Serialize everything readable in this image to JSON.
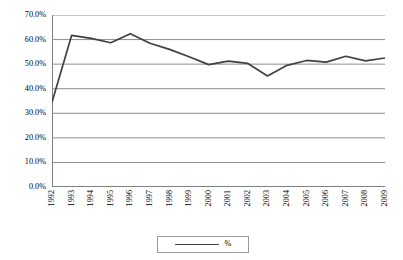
{
  "chart_data": {
    "type": "line",
    "title": "",
    "subtitle": "",
    "xlabel": "",
    "ylabel": "",
    "categories": [
      "1992",
      "1993",
      "1994",
      "1995",
      "1996",
      "1997",
      "1998",
      "1999",
      "2000",
      "2001",
      "2002",
      "2003",
      "2004",
      "2005",
      "2006",
      "2007",
      "2008",
      "2009"
    ],
    "series": [
      {
        "name": "%",
        "values": [
          34.5,
          61.7,
          60.5,
          58.7,
          62.4,
          58.5,
          56.0,
          53.0,
          49.8,
          51.2,
          50.3,
          45.2,
          49.5,
          51.5,
          50.8,
          53.2,
          51.3,
          52.5
        ],
        "color": "#404040"
      }
    ],
    "ylim": [
      0,
      70
    ],
    "ytick_values": [
      0,
      10,
      20,
      30,
      40,
      50,
      60,
      70
    ],
    "ytick_labels": [
      "0.0%",
      "10.0%",
      "20.0%",
      "30.0%",
      "40.0%",
      "50.0%",
      "60.0%",
      "70.0%"
    ],
    "grid": "horizontal",
    "grid_color": "#808080",
    "legend_position": "bottom",
    "legend_entries": [
      "%"
    ],
    "axis_color": "#808080",
    "background": "#ffffff"
  },
  "legend": {
    "label": "%"
  }
}
